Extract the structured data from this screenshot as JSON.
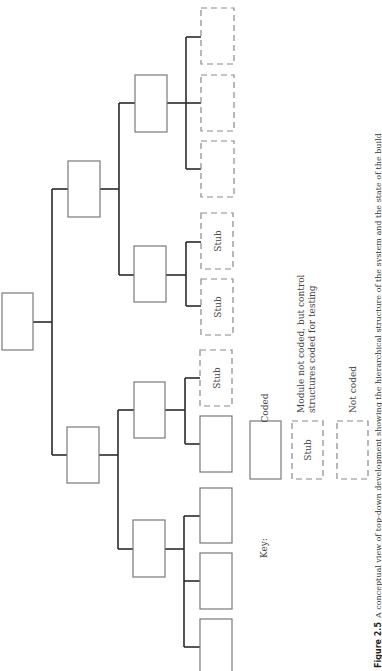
{
  "figure": {
    "caption_number": "Figure 2.5",
    "caption_text": "A conceptual view of top-down development showing the hierarchical structure of the system and the state of the build",
    "orientation": "rotated 90° clockwise (landscape figure on portrait page)"
  },
  "tree": {
    "root": {
      "label": "",
      "status": "coded"
    },
    "level1": [
      {
        "label": "",
        "status": "coded"
      },
      {
        "label": "",
        "status": "coded"
      }
    ],
    "level2": [
      {
        "parent": 0,
        "label": "",
        "status": "coded"
      },
      {
        "parent": 0,
        "label": "",
        "status": "coded"
      },
      {
        "parent": 1,
        "label": "",
        "status": "coded"
      },
      {
        "parent": 1,
        "label": "",
        "status": "coded"
      }
    ],
    "leaves": [
      {
        "parent": 0,
        "label": "",
        "status": "not-coded"
      },
      {
        "parent": 0,
        "label": "",
        "status": "not-coded"
      },
      {
        "parent": 0,
        "label": "",
        "status": "not-coded"
      },
      {
        "parent": 1,
        "label": "Stub",
        "status": "stub"
      },
      {
        "parent": 1,
        "label": "Stub",
        "status": "stub"
      },
      {
        "parent": 2,
        "label": "Stub",
        "status": "stub"
      },
      {
        "parent": 2,
        "label": "",
        "status": "coded"
      },
      {
        "parent": 3,
        "label": "",
        "status": "coded"
      },
      {
        "parent": 3,
        "label": "",
        "status": "coded"
      },
      {
        "parent": 3,
        "label": "",
        "status": "coded"
      }
    ],
    "stub_label": "Stub"
  },
  "key": {
    "title": "Key:",
    "items": [
      {
        "style": "solid",
        "box_label": "",
        "description": "Coded"
      },
      {
        "style": "dashed",
        "box_label": "Stub",
        "description_line1": "Module not coded, but control",
        "description_line2": "structures coded for testing"
      },
      {
        "style": "dashed",
        "box_label": "",
        "description": "Not coded"
      }
    ]
  },
  "colors": {
    "background": "#ffffff",
    "box_stroke": "#7a7a7a",
    "connector": "#2a2a2a",
    "text": "#444444"
  }
}
